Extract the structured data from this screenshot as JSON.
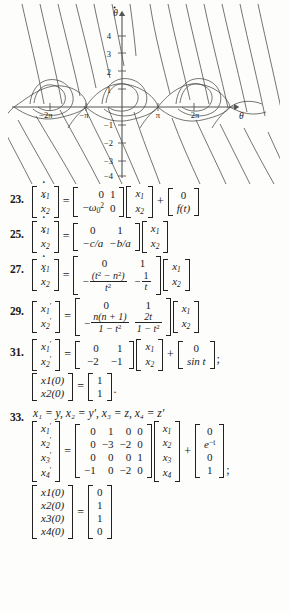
{
  "figure": {
    "name": "pendulum-phase-portrait",
    "yaxis_label": "θ̇",
    "xaxis_label": "θ",
    "y_ticks": [
      "4",
      "3",
      "2",
      "1",
      "-1",
      "-2",
      "-3",
      "-4"
    ],
    "x_ticks": [
      "-2π",
      "-π",
      "π",
      "2π"
    ],
    "stroke_color": "#3a3a3a",
    "axis_color": "#555555"
  },
  "problems": [
    {
      "number": "23.",
      "lhs": [
        "ẋ1",
        "ẋ2"
      ],
      "matrix": [
        [
          "0",
          "1"
        ],
        [
          "-ω₀²",
          "0"
        ]
      ],
      "state": [
        "x1",
        "x2"
      ],
      "forcing": [
        "0",
        "f(t)"
      ],
      "trailer": ""
    },
    {
      "number": "25.",
      "lhs": [
        "ẋ1",
        "ẋ2"
      ],
      "matrix": [
        [
          "0",
          "1"
        ],
        [
          "-c/a",
          "-b/a"
        ]
      ],
      "state": [
        "x1",
        "x2"
      ],
      "forcing": null,
      "trailer": ""
    },
    {
      "number": "27.",
      "lhs": [
        "ẋ1",
        "ẋ2"
      ],
      "matrix": [
        [
          "0",
          "1"
        ],
        [
          "-(t² - n²)/t²",
          "-1/t"
        ]
      ],
      "state": [
        "x1",
        "x2"
      ],
      "forcing": null,
      "trailer": ""
    },
    {
      "number": "29.",
      "lhs": [
        "x′1",
        "x′2"
      ],
      "matrix": [
        [
          "0",
          "1"
        ],
        [
          "-n(n+1)/(1-t²)",
          "2t/(1-t²)"
        ]
      ],
      "state": [
        "x1",
        "x2"
      ],
      "forcing": null,
      "trailer": ""
    },
    {
      "number": "31.",
      "lhs": [
        "x′1",
        "x′2"
      ],
      "matrix": [
        [
          "0",
          "1"
        ],
        [
          "-2",
          "-1"
        ]
      ],
      "state": [
        "x1",
        "x2"
      ],
      "forcing": [
        "0",
        "sin t"
      ],
      "trailer": ";",
      "initial": {
        "lhs": [
          "x1(0)",
          "x2(0)"
        ],
        "rhs": [
          "1",
          "1"
        ],
        "trailer": "."
      }
    },
    {
      "number": "33.",
      "definition": "x₁ = y, x₂ = y′, x₃ = z, x₄ = z′",
      "lhs": [
        "x′1",
        "x′2",
        "x′3",
        "x′4"
      ],
      "matrix": [
        [
          "0",
          "1",
          "0",
          "0"
        ],
        [
          "0",
          "-3",
          "-2",
          "0"
        ],
        [
          "0",
          "0",
          "0",
          "1"
        ],
        [
          "-1",
          "0",
          "-2",
          "0"
        ]
      ],
      "state": [
        "x1",
        "x2",
        "x3",
        "x4"
      ],
      "forcing": [
        "0",
        "e⁻ᵗ",
        "0",
        "1"
      ],
      "trailer": ";",
      "initial": {
        "lhs": [
          "x1(0)",
          "x2(0)",
          "x3(0)",
          "x4(0)"
        ],
        "rhs": [
          "0",
          "1",
          "1",
          "0"
        ],
        "trailer": ""
      }
    }
  ],
  "symbols": {
    "equals": "=",
    "plus": "+"
  }
}
